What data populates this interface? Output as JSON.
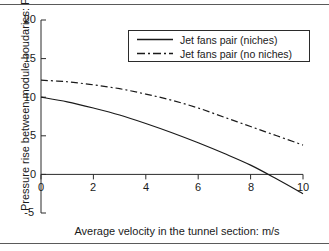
{
  "chart_data": {
    "type": "line",
    "title": "",
    "xlabel": "Average velocity in the tunnel section: m/s",
    "ylabel": "Pressure rise between module boudaries: Pa",
    "xlim": [
      0,
      10
    ],
    "ylim": [
      -5,
      20
    ],
    "xticks": [
      0,
      2,
      4,
      6,
      8,
      10
    ],
    "xtick_labels": [
      "0",
      "2",
      "4",
      "6",
      "8",
      "10"
    ],
    "yticks": [
      -5,
      0,
      5,
      10,
      15,
      20
    ],
    "ytick_labels": [
      "-5",
      "0",
      "5",
      "10",
      "15",
      "20"
    ],
    "grid": false,
    "legend_position": "upper center",
    "x": [
      0,
      1,
      2,
      3,
      4,
      5,
      6,
      7,
      8,
      9,
      10
    ],
    "series": [
      {
        "name": "Jet fans pair (niches)",
        "style": "solid",
        "color": "#1a1a1a",
        "values": [
          10.0,
          9.4,
          8.6,
          7.7,
          6.6,
          5.4,
          4.1,
          2.7,
          1.2,
          -0.6,
          -2.5
        ]
      },
      {
        "name": "Jet fans pair (no niches)",
        "style": "dash-dot",
        "color": "#1a1a1a",
        "values": [
          12.2,
          12.0,
          11.6,
          11.1,
          10.4,
          9.6,
          8.6,
          7.4,
          6.2,
          5.0,
          3.8
        ]
      }
    ]
  },
  "legend": {
    "entries": [
      {
        "label": "Jet fans pair (niches)"
      },
      {
        "label": "Jet fans pair (no niches)"
      }
    ]
  },
  "axes": {
    "x_title": "Average velocity in the tunnel section: m/s",
    "y_title": "Pressure rise between module boudaries: Pa",
    "x_tick_labels": [
      "0",
      "2",
      "4",
      "6",
      "8",
      "10"
    ],
    "y_tick_labels": [
      "20",
      "15",
      "10",
      "5",
      "0",
      "-5"
    ],
    "x_zero_tick_label": "0"
  },
  "colors": {
    "ink": "#1a1a1a",
    "axis": "#2b2b2b",
    "rule": "#5a5a5a",
    "background": "#ffffff"
  }
}
